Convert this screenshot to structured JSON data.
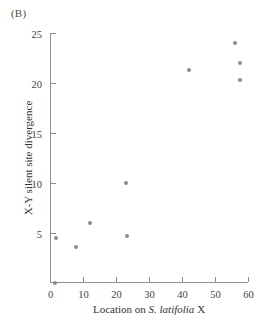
{
  "panel": {
    "label": "(B)"
  },
  "chart_data": {
    "type": "scatter",
    "title": "",
    "panel_label": "(B)",
    "xlabel": "Location on S. latifolia X",
    "xlabel_plain": "Location on ",
    "xlabel_italic": "S. latifolia",
    "xlabel_tail": " X",
    "ylabel": "X-Y silent site divergence",
    "xlim": [
      0,
      60
    ],
    "ylim": [
      0,
      25
    ],
    "xticks": [
      0,
      10,
      20,
      30,
      40,
      50,
      60
    ],
    "xticklabels": [
      "0",
      "10",
      "20",
      "30",
      "40",
      "50",
      "60"
    ],
    "yticks": [
      0,
      5,
      10,
      15,
      20,
      25
    ],
    "yticklabels": [
      "",
      "5",
      "10",
      "15",
      "20",
      "25"
    ],
    "grid": false,
    "legend": null,
    "marker_color": "#8d8d8d",
    "axis_color": "#8e8e8e",
    "points": [
      {
        "x": 1.5,
        "y": 0.0
      },
      {
        "x": 1.8,
        "y": 4.5
      },
      {
        "x": 8.0,
        "y": 3.6
      },
      {
        "x": 12.0,
        "y": 6.0
      },
      {
        "x": 23.0,
        "y": 10.0
      },
      {
        "x": 23.2,
        "y": 4.7
      },
      {
        "x": 42.0,
        "y": 21.3
      },
      {
        "x": 56.0,
        "y": 24.0
      },
      {
        "x": 57.6,
        "y": 22.0
      },
      {
        "x": 57.6,
        "y": 20.3
      }
    ]
  }
}
